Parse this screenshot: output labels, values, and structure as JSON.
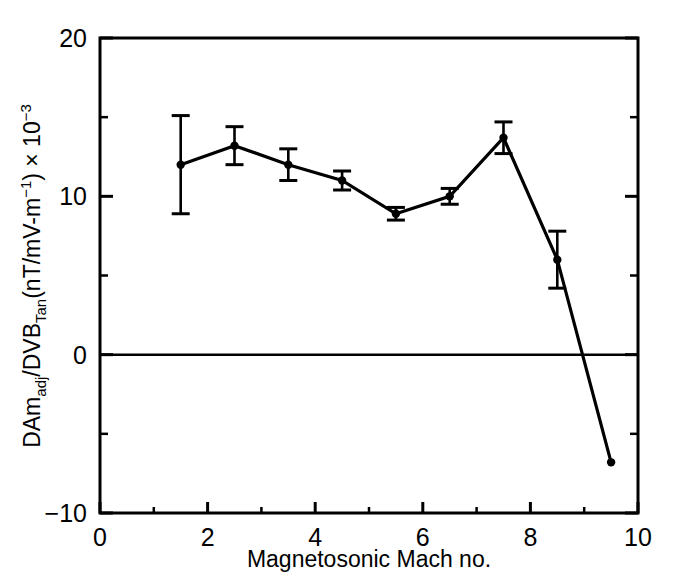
{
  "chart_data": {
    "type": "line",
    "title": "",
    "xlabel": "Magnetosonic Mach no.",
    "ylabel_parts": {
      "p1": "DAm",
      "sub1": "adj",
      "p2": "/DVB",
      "sub2": "Tan",
      "p3": "(nT/mV-m",
      "sup1": "−1",
      "p4": ") × 10",
      "sup2": "−3"
    },
    "ylabel_plain": "DAm_adj/DVB_Tan(nT/mV-m⁻¹) × 10⁻³",
    "xlim": [
      0,
      10
    ],
    "ylim": [
      -10,
      20
    ],
    "xticks": [
      0,
      2,
      4,
      6,
      8,
      10
    ],
    "xticklabels": [
      "0",
      "2",
      "4",
      "6",
      "8",
      "10"
    ],
    "xminorticks": [
      1,
      3,
      5,
      7,
      9
    ],
    "yticks": [
      -10,
      0,
      10,
      20
    ],
    "yticklabels": [
      "−10",
      "0",
      "10",
      "20"
    ],
    "yminorticks": [
      -5,
      5,
      15
    ],
    "grid": false,
    "legend": null,
    "zero_line": 0,
    "marker": "filled-circle",
    "line_color": "#000000",
    "marker_color": "#000000",
    "x": [
      1.5,
      2.5,
      3.5,
      4.5,
      5.5,
      6.5,
      7.5,
      8.5,
      9.5
    ],
    "values": [
      12.0,
      13.2,
      12.0,
      11.0,
      8.9,
      10.0,
      13.7,
      6.0,
      -6.8
    ],
    "yerr": [
      3.1,
      1.2,
      1.0,
      0.6,
      0.4,
      0.5,
      1.0,
      1.8,
      0.0
    ],
    "points": [
      {
        "x": 1.5,
        "y": 12.0,
        "err": 3.1,
        "ylow": 8.9,
        "yhigh": 15.1
      },
      {
        "x": 2.5,
        "y": 13.2,
        "err": 1.2,
        "ylow": 12.0,
        "yhigh": 14.4
      },
      {
        "x": 3.5,
        "y": 12.0,
        "err": 1.0,
        "ylow": 11.0,
        "yhigh": 13.0
      },
      {
        "x": 4.5,
        "y": 11.0,
        "err": 0.6,
        "ylow": 10.4,
        "yhigh": 11.6
      },
      {
        "x": 5.5,
        "y": 8.9,
        "err": 0.4,
        "ylow": 8.5,
        "yhigh": 9.3
      },
      {
        "x": 6.5,
        "y": 10.0,
        "err": 0.5,
        "ylow": 9.5,
        "yhigh": 10.5
      },
      {
        "x": 7.5,
        "y": 13.7,
        "err": 1.0,
        "ylow": 12.7,
        "yhigh": 14.7
      },
      {
        "x": 8.5,
        "y": 6.0,
        "err": 1.8,
        "ylow": 4.2,
        "yhigh": 7.8
      },
      {
        "x": 9.5,
        "y": -6.8,
        "err": 0.0,
        "ylow": -6.8,
        "yhigh": -6.8
      }
    ]
  }
}
